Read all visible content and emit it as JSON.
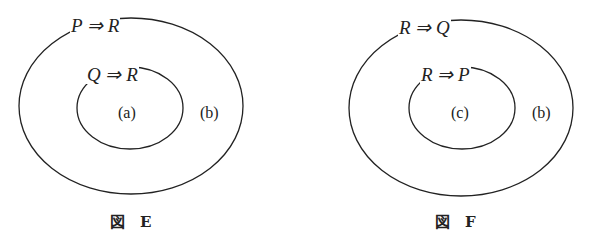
{
  "figures": [
    {
      "id": "E",
      "caption": "図　E",
      "outer_label": "P ⇒ R",
      "inner_label": "Q ⇒ R",
      "inner_region": "(a)",
      "outer_region": "(b)"
    },
    {
      "id": "F",
      "caption": "図　F",
      "outer_label": "R ⇒ Q",
      "inner_label": "R ⇒ P",
      "inner_region": "(c)",
      "outer_region": "(b)"
    }
  ],
  "colors": {
    "stroke": "#222222",
    "background": "#ffffff"
  }
}
